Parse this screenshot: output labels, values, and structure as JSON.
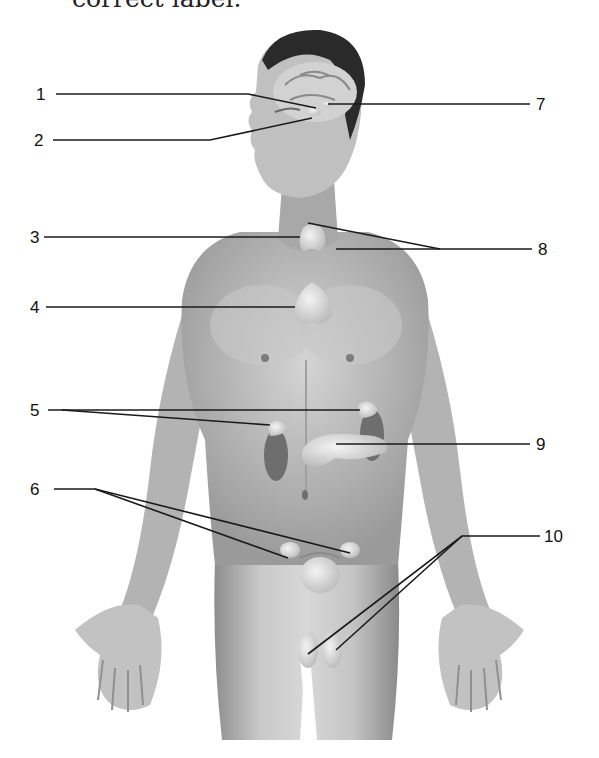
{
  "caption": {
    "text_fragment": "correct label."
  },
  "diagram": {
    "title": "",
    "type": "labeled anatomical illustration",
    "labels": [
      {
        "id": "1",
        "text": "1",
        "side": "left",
        "targets": 1
      },
      {
        "id": "2",
        "text": "2",
        "side": "left",
        "targets": 1
      },
      {
        "id": "3",
        "text": "3",
        "side": "left",
        "targets": 1
      },
      {
        "id": "4",
        "text": "4",
        "side": "left",
        "targets": 1
      },
      {
        "id": "5",
        "text": "5",
        "side": "left",
        "targets": 2
      },
      {
        "id": "6",
        "text": "6",
        "side": "left",
        "targets": 2
      },
      {
        "id": "7",
        "text": "7",
        "side": "right",
        "targets": 1
      },
      {
        "id": "8",
        "text": "8",
        "side": "right",
        "targets": 2
      },
      {
        "id": "9",
        "text": "9",
        "side": "right",
        "targets": 1
      },
      {
        "id": "10",
        "text": "10",
        "side": "right",
        "targets": 2
      }
    ],
    "colors": {
      "line": "#1a1a1a",
      "skin_light": "#d9d9d9",
      "skin_dark": "#8a8a8a",
      "hair": "#2a2a2a"
    }
  }
}
